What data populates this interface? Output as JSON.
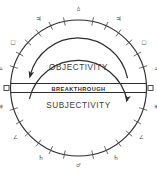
{
  "diagram": {
    "geometry": {
      "center_x": 78.5,
      "center_y": 88,
      "outer_radius": 68,
      "inner_radius": 50,
      "band_y": 88,
      "band_left_x": 10.5,
      "band_right_x": 146.5,
      "canvas_width": 157,
      "canvas_height": 175
    },
    "colors": {
      "background": "#ffffff",
      "stroke": "#2e2e2e",
      "tick": "#4e4e4e",
      "glyph": "#4a4a4a",
      "zone_text": "#3a3a3a",
      "band_text": "#2b2b2b"
    },
    "zones": [
      {
        "id": "upper",
        "label": "OBJECTIVITY",
        "label_x": 78.5,
        "label_y": 70,
        "arrow_direction": "counterclockwise"
      },
      {
        "id": "lower",
        "label": "SUBJECTIVITY",
        "label_x": 78.5,
        "label_y": 108,
        "arrow_direction": "counterclockwise"
      }
    ],
    "band": {
      "label": "BREAKTHROUGH",
      "label_x": 78.5,
      "label_y": 91.4
    },
    "axis_nodes": [
      {
        "id": "node-left",
        "name": "left-axis-node",
        "x": 6.5,
        "y": 88,
        "size": 5.0
      },
      {
        "id": "node-right",
        "name": "right-axis-node",
        "x": 150.5,
        "y": 88,
        "size": 5.0
      }
    ],
    "ring_glyphs": [
      {
        "id": "g-top",
        "symbol": "♁",
        "angle_deg": 90,
        "radius": 78,
        "size": "small"
      },
      {
        "id": "g-upper-ne",
        "symbol": "♃",
        "angle_deg": 60,
        "radius": 80,
        "size": "normal"
      },
      {
        "id": "g-upper-nw",
        "symbol": "♃",
        "angle_deg": 120,
        "radius": 80,
        "size": "normal"
      },
      {
        "id": "g-upper-e",
        "symbol": "□",
        "angle_deg": 35,
        "radius": 80,
        "size": "small"
      },
      {
        "id": "g-upper-w",
        "symbol": "□",
        "angle_deg": 145,
        "radius": 80,
        "size": "small"
      },
      {
        "id": "g-upper-ee",
        "symbol": "▵",
        "angle_deg": 14,
        "radius": 80,
        "size": "normal"
      },
      {
        "id": "g-upper-ww",
        "symbol": "▵",
        "angle_deg": 166,
        "radius": 80,
        "size": "normal"
      },
      {
        "id": "g-lower-ee",
        "symbol": "✳",
        "angle_deg": -14,
        "radius": 80,
        "size": "normal"
      },
      {
        "id": "g-lower-ww",
        "symbol": "✳",
        "angle_deg": -166,
        "radius": 80,
        "size": "normal"
      },
      {
        "id": "g-lower-e",
        "symbol": "∠",
        "angle_deg": -38,
        "radius": 80,
        "size": "small"
      },
      {
        "id": "g-lower-w",
        "symbol": "∠",
        "angle_deg": -142,
        "radius": 80,
        "size": "small"
      },
      {
        "id": "g-lower-se",
        "symbol": "♄",
        "angle_deg": -62,
        "radius": 80,
        "size": "normal"
      },
      {
        "id": "g-lower-sw",
        "symbol": "♄",
        "angle_deg": -118,
        "radius": 80,
        "size": "normal"
      },
      {
        "id": "g-bottom",
        "symbol": "♂",
        "angle_deg": -90,
        "radius": 78,
        "size": "small"
      }
    ],
    "ring_ticks": [
      {
        "angle_deg": 78
      },
      {
        "angle_deg": 66
      },
      {
        "angle_deg": 54
      },
      {
        "angle_deg": 42
      },
      {
        "angle_deg": 30
      },
      {
        "angle_deg": 18
      },
      {
        "angle_deg": 102
      },
      {
        "angle_deg": 114
      },
      {
        "angle_deg": 126
      },
      {
        "angle_deg": 138
      },
      {
        "angle_deg": 150
      },
      {
        "angle_deg": 162
      },
      {
        "angle_deg": -78
      },
      {
        "angle_deg": -66
      },
      {
        "angle_deg": -54
      },
      {
        "angle_deg": -42
      },
      {
        "angle_deg": -30
      },
      {
        "angle_deg": -18
      },
      {
        "angle_deg": -102
      },
      {
        "angle_deg": -114
      },
      {
        "angle_deg": -126
      },
      {
        "angle_deg": -138
      },
      {
        "angle_deg": -150
      },
      {
        "angle_deg": -162
      }
    ]
  }
}
